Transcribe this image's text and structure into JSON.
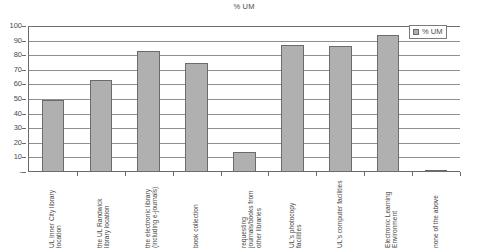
{
  "chart_data": {
    "type": "bar",
    "title": "% UM",
    "xlabel": "",
    "ylabel": "",
    "ylim": [
      0,
      100
    ],
    "ytick_labels": [
      "100",
      "90",
      "80",
      "70",
      "60",
      "50",
      "40",
      "30",
      "20",
      "10",
      "-"
    ],
    "ytick_values": [
      100,
      90,
      80,
      70,
      60,
      50,
      40,
      30,
      20,
      10,
      0
    ],
    "grid": true,
    "legend_position": "top-right",
    "legend": [
      "% UM"
    ],
    "categories": [
      "UL Inner City library location",
      "the UL Randwick library location",
      "the electronic library (including e-journals)",
      "book collection",
      "requesting journals/books from other libraries",
      "UL's photocopy facilities",
      "UL's computer facilities",
      "Electronic Learning Environment",
      "none of the above"
    ],
    "series": [
      {
        "name": "% UM",
        "values": [
          49,
          63,
          83,
          75,
          14,
          87,
          86,
          94,
          1
        ]
      }
    ],
    "colors": {
      "bar_fill": "#b0b0b0",
      "bar_border": "#6b6b6b",
      "gridline": "#8f8f8f",
      "axis": "#6a6a6a",
      "text": "#4a4a4a",
      "background": "#ffffff"
    }
  }
}
